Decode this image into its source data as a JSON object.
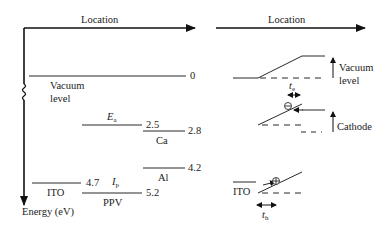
{
  "left_panel": {
    "axis_x_label": "Location",
    "axis_y_label": "Energy (eV)",
    "vacuum_label_line1": "Vacuum",
    "vacuum_label_line2": "level",
    "vacuum_value": "0",
    "ea_label": "E",
    "ea_sub": "a",
    "ea_value": "2.5",
    "ca_label": "Ca",
    "ca_value": "2.8",
    "al_label": "Al",
    "al_value": "4.2",
    "ito_label": "ITO",
    "ito_value": "4.7",
    "ip_label": "I",
    "ip_sub": "p",
    "ppv_label": "PPV",
    "ppv_value": "5.2"
  },
  "right_panel": {
    "axis_x_label": "Location",
    "vacuum_label_line1": "Vacuum",
    "vacuum_label_line2": "level",
    "te_label": "t",
    "te_sub": "e",
    "cathode_label": "Cathode",
    "ito_label": "ITO",
    "th_label": "t",
    "th_sub": "h",
    "electron_symbol": "⊖",
    "hole_symbol": "⊕"
  },
  "colors": {
    "line": "#111111",
    "text": "#222222"
  }
}
